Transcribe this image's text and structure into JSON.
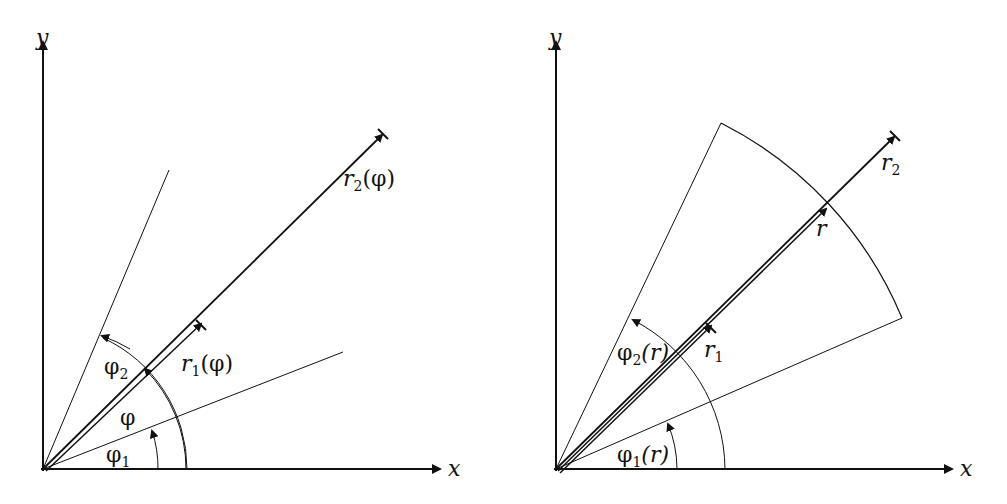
{
  "figure": {
    "background": "#ffffff",
    "stroke_color": "#111111",
    "panels": [
      {
        "id": "left",
        "description": "Region bounded by radial curves r1(phi), r2(phi) between angles phi1 and phi2",
        "axes": {
          "x_label": "x",
          "y_label": "y"
        },
        "labels": {
          "r2_main": "r",
          "r2_sub": "2",
          "r2_arg": "(φ)",
          "r1_main": "r",
          "r1_sub": "1",
          "r1_arg": "(φ)",
          "phi2_main": "φ",
          "phi2_sub": "2",
          "phi": "φ",
          "phi1_main": "φ",
          "phi1_sub": "1"
        }
      },
      {
        "id": "right",
        "description": "Annular-sector region bounded by angles phi1(r), phi2(r) between radii r1 and r2",
        "axes": {
          "x_label": "x",
          "y_label": "y"
        },
        "labels": {
          "r2_main": "r",
          "r2_sub": "2",
          "r": "r",
          "r1_main": "r",
          "r1_sub": "1",
          "phi2_main": "φ",
          "phi2_sub": "2",
          "phi2_arg": "(r)",
          "phi1_main": "φ",
          "phi1_sub": "1",
          "phi1_arg": "(r)"
        }
      }
    ]
  }
}
